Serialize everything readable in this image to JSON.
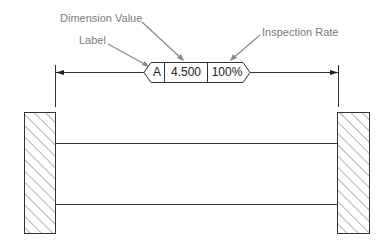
{
  "diagram": {
    "callouts": {
      "dimension_value": "Dimension Value",
      "label": "Label",
      "inspection_rate": "Inspection Rate"
    },
    "balloon": {
      "label": "A",
      "dimension_value": "4.500",
      "inspection_rate": "100%"
    },
    "colors": {
      "callout_text": "#7a7a7a",
      "leader": "#888888",
      "line": "#333333"
    }
  }
}
